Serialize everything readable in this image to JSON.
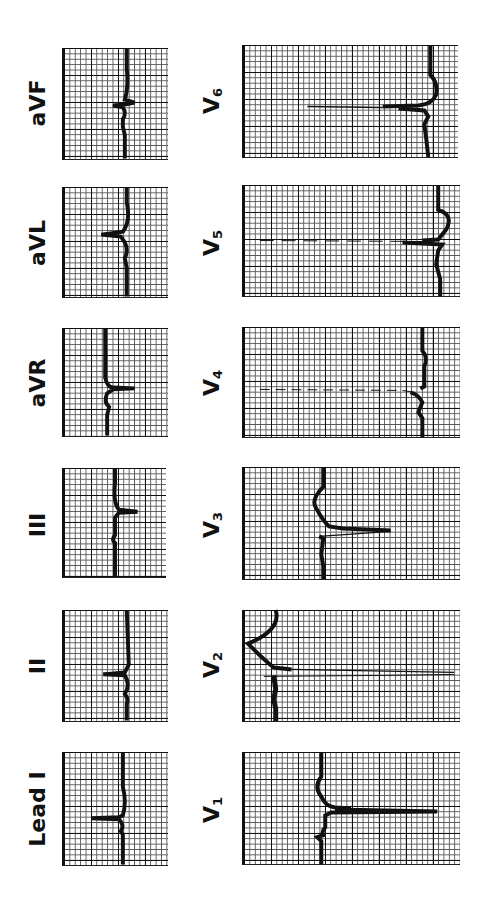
{
  "figure": {
    "orientation": "rotated 90deg counter-clockwise",
    "limb_leads": [
      {
        "id": "I",
        "label": "Lead I"
      },
      {
        "id": "II",
        "label": "II"
      },
      {
        "id": "III",
        "label": "III"
      },
      {
        "id": "aVR",
        "label": "aVR"
      },
      {
        "id": "aVL",
        "label": "aVL"
      },
      {
        "id": "aVF",
        "label": "aVF"
      }
    ],
    "precordial_leads": [
      {
        "id": "V1",
        "label": "V",
        "sub": "1"
      },
      {
        "id": "V2",
        "label": "V",
        "sub": "2"
      },
      {
        "id": "V3",
        "label": "V",
        "sub": "3"
      },
      {
        "id": "V4",
        "label": "V",
        "sub": "4"
      },
      {
        "id": "V5",
        "label": "V",
        "sub": "5"
      },
      {
        "id": "V6",
        "label": "V",
        "sub": "6"
      }
    ],
    "colors": {
      "trace": "#111111",
      "grid_major": "#111111",
      "grid_minor": "#555555",
      "background": "#ffffff"
    }
  }
}
